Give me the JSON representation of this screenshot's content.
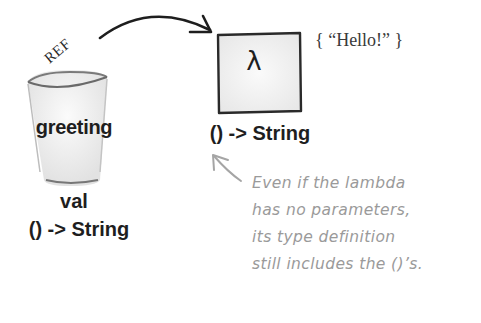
{
  "variable": {
    "name": "greeting",
    "kind": "val",
    "type": "() -> String",
    "container": "cup-icon"
  },
  "reference": {
    "label": "REF"
  },
  "lambda_object": {
    "symbol": "λ",
    "type": "() -> String",
    "body": "{ “Hello!” }"
  },
  "annotation": {
    "lines": [
      "Even if the lambda",
      "has no parameters,",
      "its type definition",
      "still includes the ()’s."
    ],
    "color": "#9a9a9a"
  },
  "colors": {
    "ink": "#1e1e1e",
    "annotation": "#9a9a9a",
    "box_fill": "#f2f2f2",
    "cup_fill": "#f4f4f4"
  }
}
